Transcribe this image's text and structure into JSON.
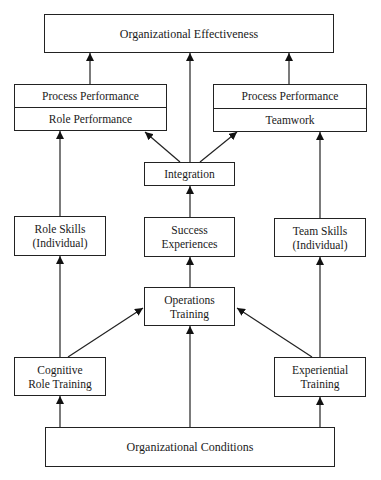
{
  "diagram": {
    "nodes": {
      "org_effectiveness": {
        "label": "Organizational Effectiveness"
      },
      "left_performance": {
        "top": "Process Performance",
        "bottom": "Role Performance"
      },
      "right_performance": {
        "top": "Process Performance",
        "bottom": "Teamwork"
      },
      "integration": {
        "label": "Integration"
      },
      "role_skills": {
        "line1": "Role Skills",
        "line2": "(Individual)"
      },
      "success_experiences": {
        "line1": "Success",
        "line2": "Experiences"
      },
      "team_skills": {
        "line1": "Team Skills",
        "line2": "(Individual)"
      },
      "operations_training": {
        "line1": "Operations",
        "line2": "Training"
      },
      "cognitive_role_training": {
        "line1": "Cognitive",
        "line2": "Role Training"
      },
      "experiential_training": {
        "line1": "Experiential",
        "line2": "Training"
      },
      "org_conditions": {
        "label": "Organizational Conditions"
      }
    },
    "edges": [
      {
        "from": "left_performance",
        "to": "org_effectiveness"
      },
      {
        "from": "integration",
        "to": "org_effectiveness"
      },
      {
        "from": "right_performance",
        "to": "org_effectiveness"
      },
      {
        "from": "integration",
        "to": "left_performance"
      },
      {
        "from": "integration",
        "to": "right_performance"
      },
      {
        "from": "role_skills",
        "to": "left_performance"
      },
      {
        "from": "team_skills",
        "to": "right_performance"
      },
      {
        "from": "success_experiences",
        "to": "integration"
      },
      {
        "from": "operations_training",
        "to": "success_experiences"
      },
      {
        "from": "cognitive_role_training",
        "to": "role_skills"
      },
      {
        "from": "cognitive_role_training",
        "to": "operations_training"
      },
      {
        "from": "experiential_training",
        "to": "team_skills"
      },
      {
        "from": "experiential_training",
        "to": "operations_training"
      },
      {
        "from": "org_conditions",
        "to": "cognitive_role_training"
      },
      {
        "from": "org_conditions",
        "to": "operations_training"
      },
      {
        "from": "org_conditions",
        "to": "experiential_training"
      }
    ]
  }
}
